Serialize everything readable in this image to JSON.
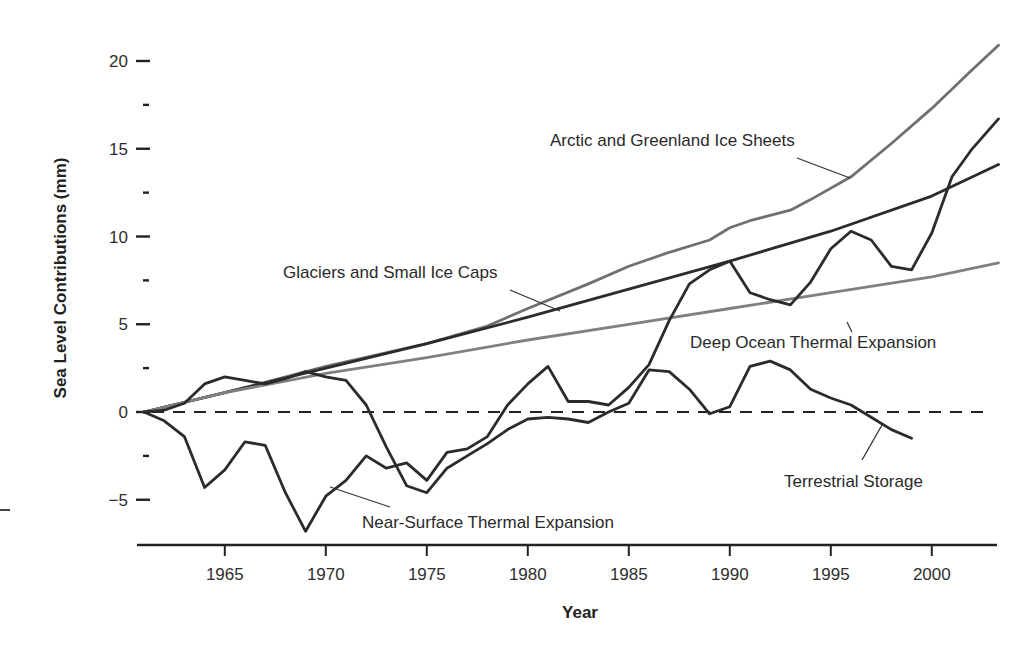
{
  "chart_data": {
    "type": "line",
    "title": "",
    "xlabel": "Year",
    "ylabel": "Sea Level Contributions (mm)",
    "xlim": [
      1961,
      2003.3
    ],
    "ylim": [
      -7.6,
      21
    ],
    "grid": false,
    "legend": "inline labels with leader lines",
    "x_ticks": [
      1965,
      1970,
      1975,
      1980,
      1985,
      1990,
      1995,
      2000
    ],
    "y_ticks": [
      20,
      15,
      10,
      5,
      0,
      -5
    ],
    "y_minor_ticks": [
      17.5,
      12.5,
      7.5,
      2.5,
      -2.5
    ],
    "zero_reference": {
      "style": "dashed",
      "x_range": [
        1961,
        2003.3
      ],
      "value": 0
    },
    "series": [
      {
        "name": "Arctic and Greenland Ice Sheets",
        "color": "#707070",
        "x": [
          1961,
          1965,
          1970,
          1975,
          1978,
          1980,
          1983,
          1985,
          1987,
          1989,
          1990,
          1991,
          1992,
          1993,
          1994,
          1996,
          1998,
          2000,
          2002,
          2003.3
        ],
        "values": [
          0,
          1.1,
          2.6,
          3.9,
          4.9,
          5.9,
          7.3,
          8.3,
          9.1,
          9.8,
          10.5,
          10.9,
          11.2,
          11.5,
          12.1,
          13.4,
          15.3,
          17.3,
          19.5,
          20.9
        ]
      },
      {
        "name": "Glaciers and Small Ice Caps",
        "color": "#2b2b2b",
        "x": [
          1961,
          1965,
          1970,
          1975,
          1980,
          1985,
          1990,
          1995,
          2000,
          2003.3
        ],
        "values": [
          0,
          1.1,
          2.5,
          3.9,
          5.4,
          7.0,
          8.6,
          10.3,
          12.3,
          14.1
        ]
      },
      {
        "name": "Deep Ocean Thermal Expansion",
        "color": "#808080",
        "x": [
          1961,
          1965,
          1970,
          1975,
          1980,
          1985,
          1990,
          1995,
          2000,
          2003.3
        ],
        "values": [
          0,
          1.1,
          2.2,
          3.1,
          4.1,
          5.0,
          5.9,
          6.8,
          7.7,
          8.5
        ]
      },
      {
        "name": "Near-Surface Thermal Expansion",
        "color": "#2b2b2b",
        "x": [
          1961,
          1962,
          1963,
          1964,
          1965,
          1966,
          1967,
          1968,
          1969,
          1970,
          1971,
          1972,
          1973,
          1974,
          1975,
          1976,
          1977,
          1978,
          1979,
          1980,
          1981,
          1982,
          1983,
          1984,
          1985,
          1986,
          1987,
          1988,
          1989,
          1990,
          1991,
          1992,
          1993,
          1994,
          1995,
          1996,
          1997,
          1998,
          1999,
          2000,
          2001,
          2002,
          2003.3
        ],
        "values": [
          0,
          -0.5,
          -1.4,
          -4.3,
          -3.3,
          -1.7,
          -1.9,
          -4.6,
          -6.8,
          -4.8,
          -3.9,
          -2.5,
          -3.2,
          -2.9,
          -3.9,
          -2.3,
          -2.1,
          -1.4,
          0.4,
          1.6,
          2.6,
          0.6,
          0.6,
          0.4,
          1.4,
          2.7,
          5.2,
          7.3,
          8.1,
          8.6,
          6.8,
          6.4,
          6.1,
          7.4,
          9.3,
          10.3,
          9.8,
          8.3,
          8.1,
          10.2,
          13.4,
          15.0,
          16.7
        ]
      },
      {
        "name": "Terrestrial Storage",
        "color": "#2b2b2b",
        "x": [
          1961,
          1962,
          1963,
          1964,
          1965,
          1966,
          1967,
          1968,
          1969,
          1970,
          1971,
          1972,
          1973,
          1974,
          1975,
          1976,
          1977,
          1978,
          1979,
          1980,
          1981,
          1982,
          1983,
          1984,
          1985,
          1986,
          1987,
          1988,
          1989,
          1990,
          1991,
          1992,
          1993,
          1994,
          1995,
          1996,
          1997,
          1998,
          1999
        ],
        "values": [
          0,
          0.1,
          0.5,
          1.6,
          2.0,
          1.8,
          1.6,
          1.9,
          2.3,
          2.0,
          1.8,
          0.4,
          -2.0,
          -4.2,
          -4.6,
          -3.2,
          -2.5,
          -1.8,
          -1.0,
          -0.4,
          -0.3,
          -0.4,
          -0.6,
          0.0,
          0.5,
          2.4,
          2.3,
          1.3,
          -0.1,
          0.3,
          2.6,
          2.9,
          2.4,
          1.3,
          0.8,
          0.4,
          -0.3,
          -1.0,
          -1.5
        ]
      }
    ],
    "annotations": [
      {
        "text": "Arctic and Greenland Ice Sheets",
        "label_x": 550,
        "label_y": 146,
        "leader_from": [
          797,
          158
        ],
        "leader_to": [
          850,
          178
        ]
      },
      {
        "text": "Glaciers and Small Ice Caps",
        "label_x": 283,
        "label_y": 278,
        "leader_from": [
          510,
          290
        ],
        "leader_to": [
          560,
          311
        ]
      },
      {
        "text": "Deep Ocean Thermal Expansion",
        "label_x": 690,
        "label_y": 348,
        "leader_from": [
          847,
          322
        ],
        "leader_to": [
          852,
          332
        ]
      },
      {
        "text": "Terrestrial Storage",
        "label_x": 784,
        "label_y": 487,
        "leader_from": [
          862,
          460
        ],
        "leader_to": [
          882,
          425
        ]
      },
      {
        "text": "Near-Surface Thermal Expansion",
        "label_x": 362,
        "label_y": 528,
        "leader_from": [
          330,
          487
        ],
        "leader_to": [
          390,
          507
        ]
      }
    ]
  },
  "axes": {
    "x_title": "Year",
    "y_title": "Sea Level Contributions (mm)"
  },
  "labels": {
    "arctic": "Arctic and Greenland Ice Sheets",
    "glaciers": "Glaciers and Small Ice Caps",
    "deep_ocean": "Deep Ocean Thermal Expansion",
    "terrestrial": "Terrestrial Storage",
    "near_surface": "Near-Surface Thermal Expansion"
  }
}
